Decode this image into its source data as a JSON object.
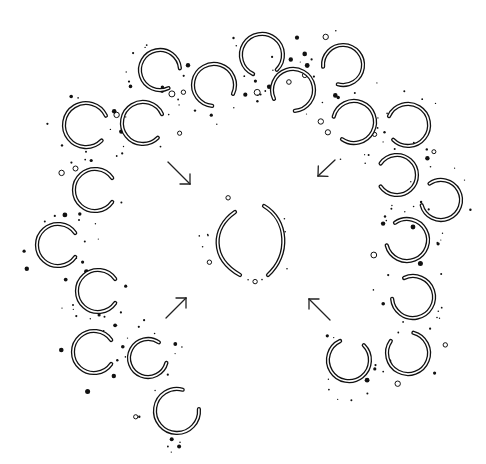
{
  "diagram": {
    "type": "pattern-illustration",
    "colors": {
      "ink": "#111111",
      "background": "#ffffff"
    },
    "center": {
      "label": "",
      "shape": "two facing arcs",
      "x": 248,
      "y": 240
    },
    "arrows": [
      {
        "direction": "down-right",
        "x1": 168,
        "y1": 162,
        "x2": 190,
        "y2": 184
      },
      {
        "direction": "down-left",
        "x1": 335,
        "y1": 160,
        "x2": 318,
        "y2": 176
      },
      {
        "direction": "up-right",
        "x1": 166,
        "y1": 318,
        "x2": 186,
        "y2": 298
      },
      {
        "direction": "up-left",
        "x1": 330,
        "y1": 320,
        "x2": 309,
        "y2": 299
      }
    ],
    "rings": [
      {
        "x": 160,
        "y": 70,
        "r": 20,
        "gap": 30
      },
      {
        "x": 214,
        "y": 85,
        "r": 21,
        "gap": 60
      },
      {
        "x": 262,
        "y": 55,
        "r": 21,
        "gap": 80
      },
      {
        "x": 293,
        "y": 90,
        "r": 21,
        "gap": 120
      },
      {
        "x": 343,
        "y": 65,
        "r": 20,
        "gap": 140
      },
      {
        "x": 354,
        "y": 122,
        "r": 21,
        "gap": 160
      },
      {
        "x": 408,
        "y": 125,
        "r": 21,
        "gap": 170
      },
      {
        "x": 397,
        "y": 175,
        "r": 20,
        "gap": 180
      },
      {
        "x": 441,
        "y": 200,
        "r": 20,
        "gap": 200
      },
      {
        "x": 407,
        "y": 240,
        "r": 21,
        "gap": 200
      },
      {
        "x": 413,
        "y": 297,
        "r": 21,
        "gap": 210
      },
      {
        "x": 408,
        "y": 353,
        "r": 21,
        "gap": 250
      },
      {
        "x": 349,
        "y": 360,
        "r": 21,
        "gap": 280
      },
      {
        "x": 86,
        "y": 125,
        "r": 22,
        "gap": 10
      },
      {
        "x": 143,
        "y": 123,
        "r": 21,
        "gap": 10
      },
      {
        "x": 95,
        "y": 190,
        "r": 21,
        "gap": 0
      },
      {
        "x": 58,
        "y": 245,
        "r": 21,
        "gap": 0
      },
      {
        "x": 98,
        "y": 291,
        "r": 21,
        "gap": 0
      },
      {
        "x": 94,
        "y": 352,
        "r": 21,
        "gap": 0
      },
      {
        "x": 148,
        "y": 358,
        "r": 19,
        "gap": 340
      },
      {
        "x": 177,
        "y": 411,
        "r": 22,
        "gap": 320
      }
    ]
  }
}
